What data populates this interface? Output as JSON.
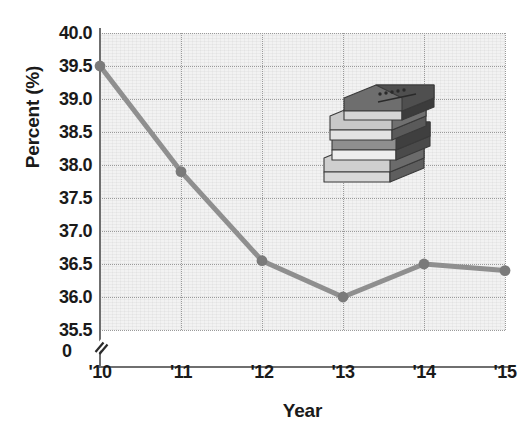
{
  "chart_data": {
    "type": "line",
    "title": "",
    "xlabel": "Year",
    "ylabel": "Percent (%)",
    "categories": [
      "'10",
      "'11",
      "'12",
      "'13",
      "'14",
      "'15"
    ],
    "values": [
      39.5,
      37.9,
      36.55,
      36.0,
      36.5,
      36.4
    ],
    "series": [
      {
        "name": "Percent",
        "values": [
          39.5,
          37.9,
          36.55,
          36.0,
          36.5,
          36.4
        ]
      }
    ],
    "ylim": [
      35.5,
      40.0
    ],
    "ytick_labels": [
      "40.0",
      "39.5",
      "39.0",
      "38.5",
      "38.0",
      "37.5",
      "37.0",
      "36.5",
      "36.0",
      "35.5"
    ],
    "ytick_values": [
      40.0,
      39.5,
      39.0,
      38.5,
      38.0,
      37.5,
      37.0,
      36.5,
      36.0,
      35.5
    ],
    "zero_label": "0",
    "axis_break": true,
    "grid": true,
    "legend": "none",
    "line_color": "#8f8f8f",
    "marker_color": "#7a7a7a",
    "plot_background": "#f2f2f2",
    "gridline_color": "#9a9a9a",
    "text_color": "#1a1a1a"
  },
  "decoration": {
    "illustration_name": "stack-of-books",
    "book_count": 4
  }
}
